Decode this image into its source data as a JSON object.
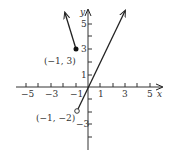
{
  "graph": {
    "axes": {
      "x_label": "x",
      "y_label": "y"
    },
    "x_ticks": [
      {
        "value": -5,
        "label": "−5"
      },
      {
        "value": -3,
        "label": "−3"
      },
      {
        "value": -1,
        "label": "−1"
      },
      {
        "value": 1,
        "label": "1"
      },
      {
        "value": 3,
        "label": "3"
      },
      {
        "value": 5,
        "label": "5"
      }
    ],
    "y_ticks": [
      {
        "value": 5,
        "label": "5"
      },
      {
        "value": 3,
        "label": "3"
      },
      {
        "value": 1,
        "label": "1"
      },
      {
        "value": -3,
        "label": "−3"
      }
    ],
    "points": [
      {
        "label": "(−1, 3)",
        "x": -1,
        "y": 3,
        "filled": true
      },
      {
        "label": "(−1, −2)",
        "x": -1,
        "y": -2,
        "filled": false
      }
    ],
    "pieces": [
      {
        "description": "y = -3x for x <= -1",
        "from": [
          -1,
          3
        ],
        "to": [
          -1.9,
          5.8
        ]
      },
      {
        "description": "y = 2x for x > -1",
        "from": [
          -1,
          -2
        ],
        "to": [
          3.1,
          6.2
        ]
      }
    ]
  }
}
